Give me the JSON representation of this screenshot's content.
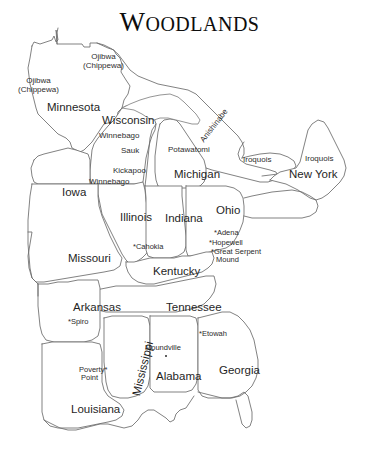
{
  "title": {
    "initial": "W",
    "remainder": "OODLANDS",
    "full": "Woodlands"
  },
  "map": {
    "region_name": "Eastern Woodlands culture area",
    "line_color": "#6b6b6b",
    "text_color": "#2b2b2b",
    "background_color": "#ffffff"
  },
  "states": [
    {
      "name": "Minnesota",
      "x": 47,
      "y": 101
    },
    {
      "name": "Wisconsin",
      "x": 102,
      "y": 114
    },
    {
      "name": "Iowa",
      "x": 62,
      "y": 186
    },
    {
      "name": "Illinois",
      "x": 120,
      "y": 211
    },
    {
      "name": "Missouri",
      "x": 68,
      "y": 252
    },
    {
      "name": "Indiana",
      "x": 165,
      "y": 212
    },
    {
      "name": "Michigan",
      "x": 174,
      "y": 168
    },
    {
      "name": "Ohio",
      "x": 216,
      "y": 204
    },
    {
      "name": "New York",
      "x": 289,
      "y": 168
    },
    {
      "name": "Kentucky",
      "x": 153,
      "y": 265
    },
    {
      "name": "Arkansas",
      "x": 73,
      "y": 301
    },
    {
      "name": "Tennessee",
      "x": 166,
      "y": 301
    },
    {
      "name": "Alabama",
      "x": 156,
      "y": 370
    },
    {
      "name": "Georgia",
      "x": 219,
      "y": 364
    },
    {
      "name": "Louisiana",
      "x": 71,
      "y": 403
    },
    {
      "name": "Mississippi",
      "x": 130,
      "y": 394,
      "rotated": true
    }
  ],
  "tribes": [
    {
      "name": "Ojibwa",
      "subname": "(Chippewa)",
      "x": 83,
      "y": 52
    },
    {
      "name": "Ojibwa",
      "subname": "(Chippewa)",
      "x": 18,
      "y": 76
    },
    {
      "name": "Winnebago",
      "x": 99,
      "y": 132
    },
    {
      "name": "Sauk",
      "x": 121,
      "y": 147
    },
    {
      "name": "Kickapoo",
      "x": 113,
      "y": 167
    },
    {
      "name": "Winnebago",
      "x": 89,
      "y": 178
    },
    {
      "name": "Potawatomi",
      "x": 168,
      "y": 146
    },
    {
      "name": "Anishinabe",
      "x": 199,
      "y": 139,
      "rotated": true
    },
    {
      "name": "Iroquois",
      "x": 243,
      "y": 156
    },
    {
      "name": "Iroquois",
      "x": 305,
      "y": 155
    }
  ],
  "sites": [
    {
      "label": "*Cahokia",
      "x": 133,
      "y": 243
    },
    {
      "label": "*Adena",
      "x": 214,
      "y": 229
    },
    {
      "label": "*Hopewell",
      "x": 209,
      "y": 239
    },
    {
      "label": "*Great Serpent",
      "x": 211,
      "y": 248,
      "second_line": "Mound",
      "second_x": 216,
      "second_y": 256
    },
    {
      "label": "*Spiro",
      "x": 68,
      "y": 318
    },
    {
      "label": "*Etowah",
      "x": 199,
      "y": 330
    },
    {
      "label": "Poverty*",
      "x": 79,
      "y": 366,
      "second_line": "Point",
      "second_x": 81,
      "second_y": 374
    },
    {
      "label": "Moundville",
      "x": 145,
      "y": 344,
      "dot_x": 165,
      "dot_y": 355
    }
  ]
}
